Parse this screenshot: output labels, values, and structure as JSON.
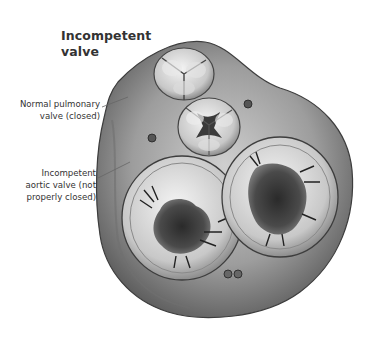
{
  "figure": {
    "title_line1": "Incompetent",
    "title_line2": "valve",
    "labels": {
      "pulmonary_line1": "Normal pulmonary",
      "pulmonary_line2": "valve (closed)",
      "aortic_line1": "Incompetent",
      "aortic_line2": "aortic valve (not",
      "aortic_line3": "properly closed)"
    },
    "colors": {
      "text": "#333333",
      "leader_line": "#666666",
      "tissue_light": "#d9d9d9",
      "tissue_mid": "#a8a8a8",
      "tissue_dark": "#4a4a4a"
    }
  }
}
